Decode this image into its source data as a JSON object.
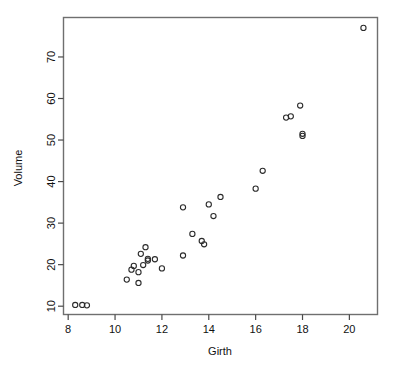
{
  "chart_data": {
    "type": "scatter",
    "title": "",
    "xlabel": "Girth",
    "ylabel": "Volume",
    "xlim": [
      7.8,
      21.2
    ],
    "ylim": [
      8.0,
      79.5
    ],
    "xticks": [
      8,
      10,
      12,
      14,
      16,
      18,
      20
    ],
    "xtick_labels": [
      "8",
      "10",
      "12",
      "14",
      "16",
      "18",
      "20"
    ],
    "yticks": [
      10,
      20,
      30,
      40,
      50,
      60,
      70
    ],
    "ytick_labels": [
      "10",
      "20",
      "30",
      "40",
      "50",
      "60",
      "70"
    ],
    "grid": false,
    "legend": false,
    "marker": "open-circle",
    "marker_color": "#2b2b2b",
    "frame_color": "#6f6f6f",
    "background": "#ffffff",
    "x": [
      8.3,
      8.6,
      8.8,
      10.5,
      10.7,
      10.8,
      11.0,
      11.0,
      11.1,
      11.2,
      11.3,
      11.4,
      11.4,
      11.7,
      12.0,
      12.9,
      12.9,
      13.3,
      13.7,
      13.8,
      14.0,
      14.2,
      14.5,
      16.0,
      16.3,
      17.3,
      17.5,
      17.9,
      18.0,
      18.0,
      20.6
    ],
    "y": [
      10.3,
      10.3,
      10.2,
      16.4,
      18.8,
      19.7,
      15.6,
      18.2,
      22.6,
      19.9,
      24.2,
      21.0,
      21.4,
      21.3,
      19.1,
      22.2,
      33.8,
      27.4,
      25.7,
      24.9,
      34.5,
      31.7,
      36.3,
      38.3,
      42.6,
      55.4,
      55.7,
      58.3,
      51.5,
      51.0,
      77.0
    ],
    "n_points": 31
  },
  "axes": {
    "x_title": "Girth",
    "y_title": "Volume"
  }
}
